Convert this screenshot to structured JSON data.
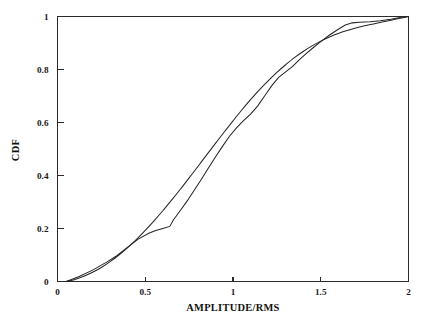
{
  "chart_data": {
    "type": "line",
    "title": "",
    "subtitle": "",
    "xlabel": "AMPLITUDE/RMS",
    "ylabel": "CDF",
    "xlim": [
      0,
      2
    ],
    "ylim": [
      0,
      1
    ],
    "xticks": [
      0,
      0.5,
      1,
      1.5,
      2
    ],
    "xticklabels": [
      "0",
      "0.5",
      "1",
      "1.5",
      "2"
    ],
    "yticks": [
      0,
      0.2,
      0.4,
      0.6,
      0.8,
      1
    ],
    "yticklabels": [
      "0",
      "0.2",
      "0.4",
      "0.6",
      "0.8",
      "1"
    ],
    "grid": false,
    "legend": null,
    "legend_position": "none",
    "frame": "box",
    "annotations": [],
    "series": [
      {
        "name": "theoretical-cdf",
        "style": "smooth",
        "color": "#262626",
        "x": [
          0.05,
          0.1,
          0.15,
          0.2,
          0.25,
          0.3,
          0.35,
          0.4,
          0.45,
          0.5,
          0.55,
          0.6,
          0.65,
          0.7,
          0.75,
          0.8,
          0.85,
          0.9,
          0.95,
          1.0,
          1.05,
          1.1,
          1.15,
          1.2,
          1.25,
          1.3,
          1.35,
          1.4,
          1.45,
          1.5,
          1.55,
          1.6,
          1.65,
          1.7,
          1.75,
          1.8,
          1.85,
          1.9,
          1.95,
          2.0
        ],
        "y": [
          0.0,
          0.008,
          0.02,
          0.035,
          0.053,
          0.075,
          0.1,
          0.128,
          0.159,
          0.193,
          0.229,
          0.267,
          0.307,
          0.348,
          0.391,
          0.434,
          0.478,
          0.521,
          0.564,
          0.606,
          0.647,
          0.686,
          0.723,
          0.757,
          0.789,
          0.818,
          0.845,
          0.868,
          0.889,
          0.907,
          0.923,
          0.936,
          0.947,
          0.957,
          0.965,
          0.972,
          0.979,
          0.986,
          0.993,
          1.0
        ]
      },
      {
        "name": "measured-cdf",
        "style": "piecewise-linear",
        "color": "#262626",
        "x": [
          0.05,
          0.12,
          0.2,
          0.28,
          0.34,
          0.4,
          0.46,
          0.52,
          0.56,
          0.6,
          0.64,
          0.66,
          0.7,
          0.74,
          0.78,
          0.82,
          0.86,
          0.9,
          0.94,
          0.98,
          1.02,
          1.06,
          1.1,
          1.14,
          1.18,
          1.22,
          1.26,
          1.3,
          1.34,
          1.38,
          1.42,
          1.46,
          1.5,
          1.55,
          1.6,
          1.64,
          1.68,
          1.72,
          1.78,
          1.84,
          1.9,
          1.95,
          2.0
        ],
        "y": [
          0.0,
          0.018,
          0.043,
          0.073,
          0.098,
          0.13,
          0.16,
          0.182,
          0.192,
          0.2,
          0.208,
          0.232,
          0.268,
          0.305,
          0.345,
          0.386,
          0.428,
          0.47,
          0.51,
          0.548,
          0.58,
          0.607,
          0.632,
          0.662,
          0.7,
          0.738,
          0.77,
          0.791,
          0.812,
          0.838,
          0.862,
          0.884,
          0.905,
          0.93,
          0.952,
          0.968,
          0.976,
          0.978,
          0.98,
          0.984,
          0.99,
          0.996,
          1.0
        ]
      }
    ]
  },
  "axes": {
    "x_title": "AMPLITUDE/RMS",
    "y_title": "CDF"
  }
}
